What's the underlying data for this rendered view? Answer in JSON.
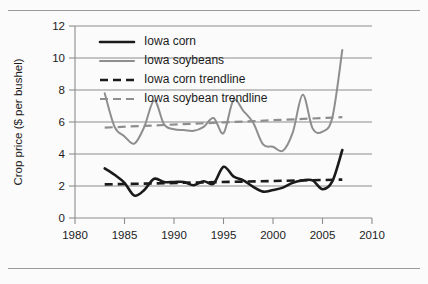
{
  "chart_data": {
    "type": "line",
    "title": "",
    "xlabel": "",
    "ylabel": "Crop price ($ per bushel)",
    "xlim": [
      1980,
      2010
    ],
    "ylim": [
      0,
      12
    ],
    "xticks": [
      1980,
      1985,
      1990,
      1995,
      2000,
      2005,
      2010
    ],
    "yticks": [
      0,
      2,
      4,
      6,
      8,
      10,
      12
    ],
    "xtick_labels": [
      "1980",
      "1985",
      "1990",
      "1995",
      "2000",
      "2005",
      "2010"
    ],
    "ytick_labels": [
      "0",
      "2",
      "4",
      "6",
      "8",
      "10",
      "12"
    ],
    "grid": "horizontal",
    "legend_position": "top-left-inside",
    "x": [
      1983,
      1984,
      1985,
      1986,
      1987,
      1988,
      1989,
      1990,
      1991,
      1992,
      1993,
      1994,
      1995,
      1996,
      1997,
      1998,
      1999,
      2000,
      2001,
      2002,
      2003,
      2004,
      2005,
      2006,
      2007
    ],
    "series": [
      {
        "name": "Iowa corn",
        "style": "solid",
        "color": "#1a1a1a",
        "values": [
          3.1,
          2.7,
          2.2,
          1.4,
          1.75,
          2.45,
          2.25,
          2.25,
          2.25,
          2.05,
          2.3,
          2.15,
          3.2,
          2.6,
          2.35,
          1.95,
          1.65,
          1.75,
          1.9,
          2.2,
          2.35,
          2.35,
          1.8,
          2.3,
          4.25
        ]
      },
      {
        "name": "Iowa soybeans",
        "style": "solid",
        "color": "#8e8e8e",
        "values": [
          7.8,
          5.7,
          5.1,
          4.65,
          5.7,
          7.35,
          5.85,
          5.55,
          5.5,
          5.45,
          5.7,
          6.25,
          5.3,
          7.35,
          6.7,
          5.95,
          4.6,
          4.45,
          4.2,
          5.35,
          7.7,
          5.6,
          5.4,
          6.3,
          10.5
        ]
      },
      {
        "name": "Iowa corn trendline",
        "style": "dashed",
        "color": "#1a1a1a",
        "trend_x": [
          1983,
          2007
        ],
        "trend_y": [
          2.1,
          2.4
        ]
      },
      {
        "name": "Iowa soybean trendline",
        "style": "dashed",
        "color": "#8e8e8e",
        "trend_x": [
          1983,
          2007
        ],
        "trend_y": [
          5.65,
          6.3
        ]
      }
    ],
    "legend": [
      {
        "label": "Iowa corn",
        "style": "solid",
        "color": "#1a1a1a"
      },
      {
        "label": "Iowa soybeans",
        "style": "solid",
        "color": "#8e8e8e"
      },
      {
        "label": "Iowa corn trendline",
        "style": "dashed",
        "color": "#1a1a1a"
      },
      {
        "label": "Iowa soybean trendline",
        "style": "dashed",
        "color": "#8e8e8e"
      }
    ]
  },
  "figure": {
    "background_color": "#fbfbfb",
    "rule_color": "#9a9a9a",
    "axis_color": "#8d8d8d"
  }
}
